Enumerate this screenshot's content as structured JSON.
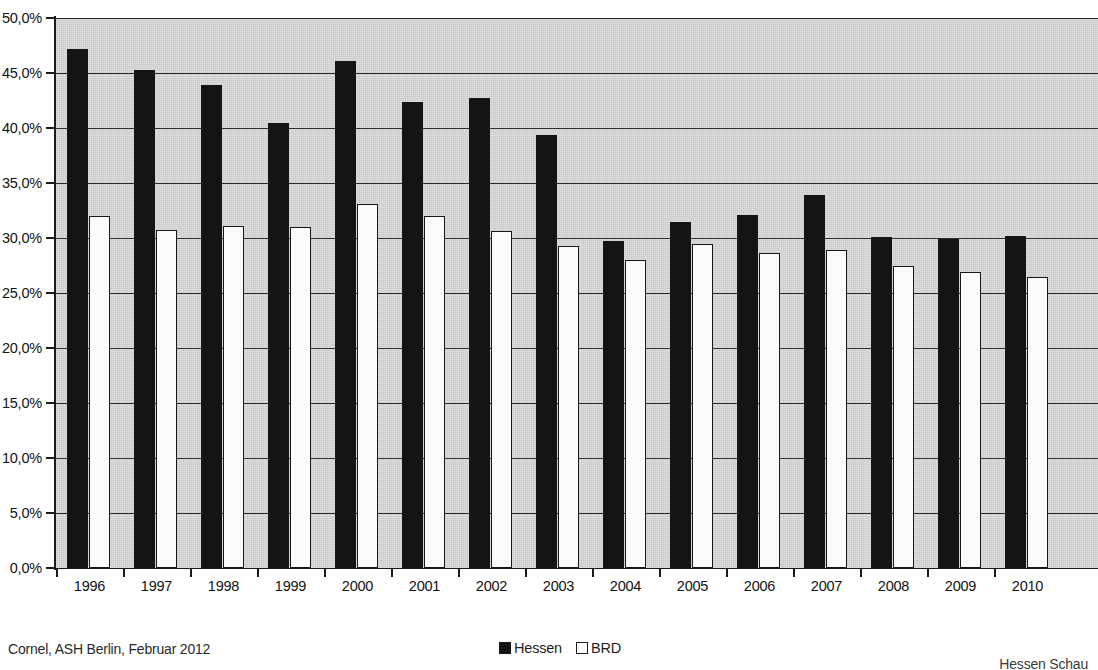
{
  "chart_data": {
    "type": "bar",
    "title": "",
    "subtitle": "",
    "xlabel": "",
    "ylabel": "",
    "ylim": [
      0,
      50
    ],
    "ytick_step": 5,
    "ytick_labels": [
      "0,0%",
      "5,0%",
      "10,0%",
      "15,0%",
      "20,0%",
      "25,0%",
      "30,0%",
      "35,0%",
      "40,0%",
      "45,0%",
      "50,0%"
    ],
    "ytick_values": [
      0,
      5,
      10,
      15,
      20,
      25,
      30,
      35,
      40,
      45,
      50
    ],
    "grid": "horizontal",
    "legend_position": "bottom-center",
    "categories": [
      "1996",
      "1997",
      "1998",
      "1999",
      "2000",
      "2001",
      "2002",
      "2003",
      "2004",
      "2005",
      "2006",
      "2007",
      "2008",
      "2009",
      "2010"
    ],
    "series": [
      {
        "name": "Hessen",
        "color": "#141414",
        "values": [
          47.2,
          45.3,
          43.9,
          40.5,
          46.1,
          42.4,
          42.7,
          39.4,
          29.7,
          31.5,
          32.1,
          33.9,
          30.1,
          29.9,
          30.2
        ]
      },
      {
        "name": "BRD",
        "color": "#fbfbfb",
        "values": [
          32.0,
          30.7,
          31.1,
          31.0,
          33.1,
          32.0,
          30.6,
          29.3,
          28.0,
          29.5,
          28.6,
          28.9,
          27.5,
          26.9,
          26.5
        ]
      }
    ],
    "plot_background": "#d4d4d4"
  },
  "legend": {
    "items": [
      {
        "label": "Hessen",
        "swatch": "filled-black-square"
      },
      {
        "label": "BRD",
        "swatch": "outlined-white-square"
      }
    ]
  },
  "footer": {
    "source": "Cornel, ASH Berlin, Februar 2012",
    "right_caption": "Hessen Schau"
  }
}
